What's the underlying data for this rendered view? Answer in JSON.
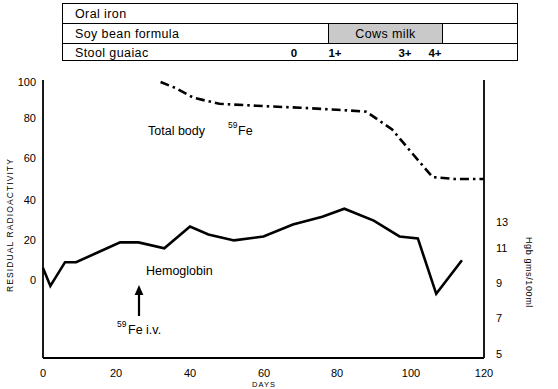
{
  "treatment_table": {
    "rows": [
      {
        "label": "Oral iron"
      },
      {
        "label": "Soy bean formula",
        "overlay_label": "Cows milk"
      },
      {
        "label": "Stool guaiac"
      }
    ],
    "guaiac_marks": [
      {
        "value": "0",
        "day": 63
      },
      {
        "value": "1+",
        "day": 74
      },
      {
        "value": "3+",
        "day": 93
      },
      {
        "value": "4+",
        "day": 101
      }
    ]
  },
  "chart_data": {
    "type": "line",
    "title": "",
    "xlabel": "DAYS",
    "ylabel": "RESIDUAL  RADIOACTIVITY",
    "y2label": "Hgb gms/100ml",
    "xlim": [
      0,
      123
    ],
    "ylim": [
      0,
      105
    ],
    "y2lim": [
      4.2,
      13.9
    ],
    "xticks": [
      0,
      20,
      40,
      60,
      80,
      100,
      120
    ],
    "yticks": [
      0,
      20,
      40,
      60,
      80,
      100
    ],
    "y2ticks": [
      5,
      7,
      9,
      11,
      13
    ],
    "grid": false,
    "legend": "inline-annotations",
    "series": [
      {
        "name": "Total body 59Fe",
        "label_text": "Total body",
        "label_sup": "59",
        "label_sub": "Fe",
        "axis": "left",
        "style": "dash-dot",
        "x": [
          32,
          36,
          41,
          48,
          58,
          70,
          80,
          88,
          95,
          100,
          106,
          112,
          120
        ],
        "y": [
          100,
          97,
          92,
          89,
          88,
          87,
          86,
          85,
          76,
          65,
          52,
          51,
          51
        ]
      },
      {
        "name": "Hemoglobin",
        "label_text": "Hemoglobin",
        "axis": "right",
        "style": "solid",
        "x": [
          0,
          2,
          6,
          9,
          15,
          21,
          26,
          33,
          40,
          45,
          52,
          60,
          68,
          76,
          82,
          90,
          97,
          102,
          107,
          114
        ],
        "y_left_scale": [
          6,
          -3,
          9,
          9,
          14,
          19,
          19,
          16,
          27,
          23,
          20,
          22,
          28,
          32,
          36,
          30,
          22,
          21,
          -7,
          10
        ]
      }
    ],
    "annotations": [
      {
        "text": "59Fe i.v.",
        "sup": "59",
        "rest": "Fe  i.v.",
        "day": 26,
        "arrow": "up"
      }
    ]
  }
}
